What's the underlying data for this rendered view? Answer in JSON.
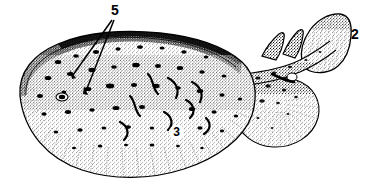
{
  "figure": {
    "style": "pen-and-ink stipple scientific illustration",
    "background_color": "#ffffff",
    "ink_color": "#000000",
    "callouts": [
      {
        "id": "5",
        "label": "5",
        "target": "anterior dorsal surface (spiracle / ridge region)",
        "leader_lines": 2
      },
      {
        "id": "2",
        "label": "2",
        "target": "caudal fin",
        "leader_lines": 0
      },
      {
        "id": "3",
        "label": "3",
        "target": "pectoral disc centre",
        "leader_lines": 0
      }
    ],
    "parts": [
      {
        "name": "pectoral-disc",
        "description": "large oval body disc, heavily stippled with dark blotches"
      },
      {
        "name": "eye",
        "description": "small dark eye on left anterior disc"
      },
      {
        "name": "pelvic-fin",
        "description": "rounded lobe behind and right of the disc"
      },
      {
        "name": "tail",
        "description": "thick tapering tail extending to upper right"
      },
      {
        "name": "first-dorsal-fin",
        "description": "triangular fin on tail"
      },
      {
        "name": "second-dorsal-fin",
        "description": "triangular fin on tail, behind first"
      },
      {
        "name": "caudal-fin",
        "description": "large paddle-shaped terminal fin"
      }
    ]
  }
}
